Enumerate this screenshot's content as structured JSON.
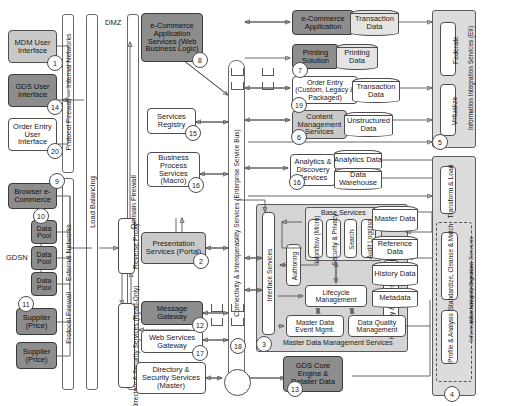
{
  "labels": {
    "dmz": "DMZ",
    "gdsn": "GDSN",
    "mdm_services_caption": "Master Data Management Services"
  },
  "bars": [
    {
      "id": "protocol-firewall-internal",
      "text": "Protocol Firewall — Internal Networks"
    },
    {
      "id": "protocol-firewall-external",
      "text": "Protocol Firewall — External Networks"
    },
    {
      "id": "load-balancing",
      "text": "Load Balancing"
    },
    {
      "id": "domain-firewall",
      "text": "Domain Firewall"
    },
    {
      "id": "esb",
      "text": "Connectivity & Interoperability Services (Enterprise Service Bus)"
    }
  ],
  "left_column": [
    {
      "id": "mdm-user-interface",
      "text": "MDM User Interface",
      "num": "1",
      "fill": "mid"
    },
    {
      "id": "gds-user-interface",
      "text": "GDS User Interface",
      "num": "14",
      "fill": "dark"
    },
    {
      "id": "order-entry-user-interface",
      "text": "Order Entry User Interface",
      "num": "20",
      "fill": "white"
    },
    {
      "id": "browser-e-commerce",
      "text": "Browser e-Commerce",
      "num": "9",
      "fill": "dark"
    },
    {
      "id": "data-pool-1",
      "text": "Data Pool",
      "num": "10",
      "fill": "dark"
    },
    {
      "id": "data-pool-2",
      "text": "Data Pool",
      "num": "",
      "fill": "dark"
    },
    {
      "id": "data-pool-3",
      "text": "Data Pool",
      "num": "",
      "fill": "dark"
    },
    {
      "id": "supplier-price-1",
      "text": "Supplier (Price)",
      "num": "11",
      "fill": "dark"
    },
    {
      "id": "supplier-price-2",
      "text": "Supplier (Price)",
      "num": "",
      "fill": "dark"
    }
  ],
  "dmz_column": [
    {
      "id": "reverse-proxy",
      "text": "Reverse Proxy"
    },
    {
      "id": "directory-security-read-only",
      "text": "Directory & Security Services (Read-Only)"
    }
  ],
  "services_column": [
    {
      "id": "e-commerce-application-services",
      "text": "e-Commerce Application Services (Web Business Logic)",
      "num": "8",
      "fill": "dark"
    },
    {
      "id": "services-registry",
      "text": "Services Registry",
      "num": "15",
      "fill": "white"
    },
    {
      "id": "business-process-services",
      "text": "Business Process Services (Macro)",
      "num": "16",
      "fill": "white"
    },
    {
      "id": "presentation-services-portal",
      "text": "Presentation Services (Portal)",
      "num": "2",
      "fill": "mid"
    },
    {
      "id": "message-gateway",
      "text": "Message Gateway",
      "num": "12",
      "fill": "dark"
    },
    {
      "id": "web-services-gateway",
      "text": "Web Services Gateway",
      "num": "17",
      "fill": "white"
    },
    {
      "id": "directory-security-services-master",
      "text": "Directory & Security Services (Master)",
      "num": "",
      "fill": "white"
    }
  ],
  "apps_column": [
    {
      "id": "e-commerce-application",
      "text": "e-Commerce Application",
      "num": "",
      "fill": "dark",
      "data": {
        "id": "transaction-data-1",
        "text": "Transaction Data",
        "fill": "grey"
      }
    },
    {
      "id": "printing-solution",
      "text": "Printing Solution",
      "num": "7",
      "fill": "dark",
      "data": {
        "id": "printing-data",
        "text": "Printing Data",
        "fill": "grey"
      }
    },
    {
      "id": "order-entry",
      "text": "Order Entry (Custom, Legacy & Packaged)",
      "num": "19",
      "fill": "white",
      "data": {
        "id": "transaction-data-2",
        "text": "Transaction Data",
        "fill": "white"
      }
    },
    {
      "id": "content-management-services",
      "text": "Content Management Services",
      "num": "6",
      "fill": "mid",
      "data": {
        "id": "unstructured-data",
        "text": "Unstructured Data",
        "fill": "white"
      }
    },
    {
      "id": "analytics-discovery-services",
      "text": "Analytics & Discovery Services",
      "num": "16",
      "fill": "white",
      "data": {
        "id": "analytics-data",
        "text": "Analytics Data",
        "fill": "white"
      },
      "data2": {
        "id": "data-warehouse",
        "text": "Data Warehouse",
        "fill": "white"
      }
    }
  ],
  "mdm": {
    "caption": "Master Data Management Services",
    "num": "3",
    "interface_services": "Interface Services",
    "base_services_title": "Base Services",
    "base_services": [
      {
        "id": "workflow-micro",
        "text": "Workflow (Micro)"
      },
      {
        "id": "security-privacy",
        "text": "Security & Privacy"
      },
      {
        "id": "search",
        "text": "Search"
      },
      {
        "id": "audit-logging",
        "text": "Audit Logging"
      }
    ],
    "authoring": "Authoring",
    "lifecycle_management": "Lifecycle Management",
    "hierarchy_relationship_mgmt": "Hierarchy & Relationship Mgmt",
    "master_data_event_mgmt": "Master Data Event Mgmt.",
    "data_quality_management": "Data Quality Management"
  },
  "data_stores": [
    {
      "id": "master-data",
      "text": "Master Data"
    },
    {
      "id": "reference-data",
      "text": "Reference Data"
    },
    {
      "id": "history-data",
      "text": "History Data"
    },
    {
      "id": "metadata",
      "text": "Metadata"
    }
  ],
  "gds_core": {
    "id": "gds-core-engine-retailer-data",
    "text": "GDS Core Engine & Retailer Data",
    "num": "13"
  },
  "right_panels": {
    "eii": {
      "id": "information-integration-services-eii",
      "text": "Information Integration Services (EII)",
      "num": "5",
      "items": [
        {
          "id": "federate",
          "text": "Federate"
        },
        {
          "id": "virtualize",
          "text": "Virtualize"
        }
      ]
    },
    "iis": {
      "id": "information-integration-services",
      "text": "Information Integration Services",
      "num": "4",
      "items": [
        {
          "id": "transform-load",
          "text": "Transform & Load"
        }
      ],
      "integrity": {
        "id": "information-integrity-services",
        "text": "Information Integrity Services",
        "items": [
          {
            "id": "standardize-cleanse-match",
            "text": "Standardize, Cleanse & Match"
          },
          {
            "id": "profile-analysis",
            "text": "Profile & Analysis"
          }
        ]
      }
    }
  },
  "colors": {
    "dark": "#8d8d8d",
    "mid": "#c9c9c9",
    "light": "#efefef",
    "stroke": "#585858",
    "group": "#d4d4d4"
  }
}
